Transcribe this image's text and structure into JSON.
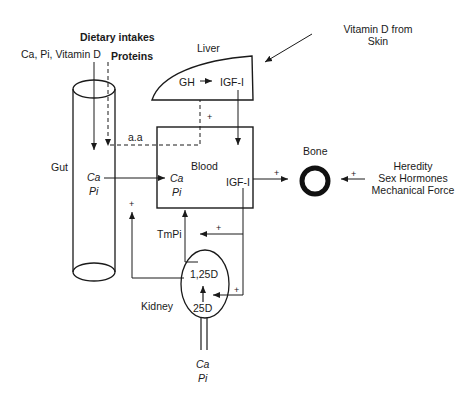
{
  "diagram": {
    "labels": {
      "dietary_intakes": "Dietary intakes",
      "ca_pi_vitd": "Ca, Pi, Vitamin D",
      "proteins": "Proteins",
      "liver": "Liver",
      "vitd_skin_line1": "Vitamin D from",
      "vitd_skin_line2": "Skin",
      "gh": "GH",
      "igf1_liver": "IGF-I",
      "aa": "a.a",
      "gut": "Gut",
      "gut_ca": "Ca",
      "gut_pi": "Pi",
      "blood": "Blood",
      "blood_ca": "Ca",
      "blood_pi": "Pi",
      "igf1_blood": "IGF-I",
      "bone": "Bone",
      "heredity": "Heredity",
      "sex_hormones": "Sex Hormones",
      "mechanical_force": "Mechanical Force",
      "tmpi": "TmPi",
      "kidney": "Kidney",
      "d125": "1,25D",
      "d25": "25D",
      "urine_ca": "Ca",
      "urine_pi": "Pi",
      "plus": "+"
    },
    "nodes": [
      "Gut",
      "Liver",
      "Blood",
      "Bone",
      "Kidney"
    ],
    "edges": [
      {
        "from": "Dietary Ca, Pi, Vitamin D",
        "to": "Gut",
        "style": "solid"
      },
      {
        "from": "Dietary Proteins",
        "to": "Gut",
        "style": "dashed"
      },
      {
        "from": "Gut (a.a)",
        "to": "Liver GH→IGF-I",
        "style": "dashed",
        "sign": "+"
      },
      {
        "from": "GH",
        "to": "IGF-I (Liver)",
        "style": "solid"
      },
      {
        "from": "IGF-I (Liver)",
        "to": "Blood",
        "style": "solid"
      },
      {
        "from": "Gut Ca/Pi",
        "to": "Blood Ca/Pi",
        "style": "solid"
      },
      {
        "from": "Blood IGF-I",
        "to": "Bone",
        "style": "solid",
        "sign": "+"
      },
      {
        "from": "Heredity / Sex Hormones / Mechanical Force",
        "to": "Bone",
        "style": "solid",
        "sign": "+"
      },
      {
        "from": "Vitamin D from Skin",
        "to": "Liver",
        "style": "solid"
      },
      {
        "from": "Blood IGF-I",
        "to": "TmPi",
        "style": "solid",
        "sign": "+"
      },
      {
        "from": "Blood IGF-I",
        "to": "Kidney 25D→1,25D",
        "style": "solid",
        "sign": "+"
      },
      {
        "from": "Kidney 1,25D",
        "to": "Gut",
        "style": "solid",
        "sign": "+"
      },
      {
        "from": "TmPi",
        "to": "Blood",
        "style": "solid"
      },
      {
        "from": "25D",
        "to": "1,25D",
        "style": "solid"
      }
    ]
  }
}
